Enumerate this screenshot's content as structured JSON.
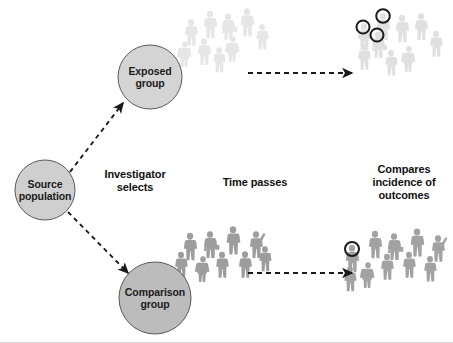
{
  "figure": {
    "type": "cohort-study-schematic",
    "background_color": "#ffffff",
    "bottom_rule_color": "#d8d8d8"
  },
  "nodes": [
    {
      "id": "source-population",
      "label": "Source\npopulation",
      "cx": 45,
      "cy": 190,
      "r": 30,
      "fill": "#cfcfcf",
      "stroke": "#555555"
    },
    {
      "id": "exposed-group",
      "label": "Exposed\ngroup",
      "cx": 150,
      "cy": 77,
      "r": 32,
      "fill": "#d4d4d4",
      "stroke": "#555555"
    },
    {
      "id": "comparison-group",
      "label": "Comparison\ngroup",
      "cx": 155,
      "cy": 298,
      "r": 36,
      "fill": "#bcbcbc",
      "stroke": "#555555"
    }
  ],
  "stage_labels": [
    {
      "id": "investigator-selects",
      "text": "Investigator\nselects",
      "x": 135,
      "y": 168
    },
    {
      "id": "time-passes",
      "text": "Time passes",
      "x": 255,
      "y": 176
    },
    {
      "id": "compares-incidence",
      "text": "Compares\nincidence of\noutcomes",
      "x": 404,
      "y": 163
    }
  ],
  "arrows": [
    {
      "id": "select-exposed-arrow",
      "from": [
        70,
        172
      ],
      "to": [
        123,
        103
      ],
      "style": "dashed",
      "color": "#1a1a1a"
    },
    {
      "id": "select-comparison-arrow",
      "from": [
        68,
        212
      ],
      "to": [
        127,
        272
      ],
      "style": "dashed",
      "color": "#1a1a1a"
    },
    {
      "id": "exposed-followup-arrow",
      "from": [
        248,
        73
      ],
      "to": [
        352,
        73
      ],
      "style": "dashed",
      "color": "#1a1a1a"
    },
    {
      "id": "comparison-followup-arrow",
      "from": [
        248,
        273
      ],
      "to": [
        352,
        273
      ],
      "style": "dashed",
      "color": "#1a1a1a"
    }
  ],
  "crowds": [
    {
      "id": "exposed-baseline-crowd",
      "tone": "#e7e7e7",
      "count": 9,
      "outcome_marked": 0
    },
    {
      "id": "exposed-followup-crowd",
      "tone": "#e0e0e0",
      "count": 9,
      "outcome_marked": 3
    },
    {
      "id": "comparison-baseline-crowd",
      "tone": "#9e9e9e",
      "count": 9,
      "outcome_marked": 0
    },
    {
      "id": "comparison-followup-crowd",
      "tone": "#a3a3a3",
      "count": 10,
      "outcome_marked": 1
    }
  ],
  "outcome_marker": {
    "stroke": "#1a1a1a",
    "radius": 6.5,
    "stroke_width": 2
  }
}
